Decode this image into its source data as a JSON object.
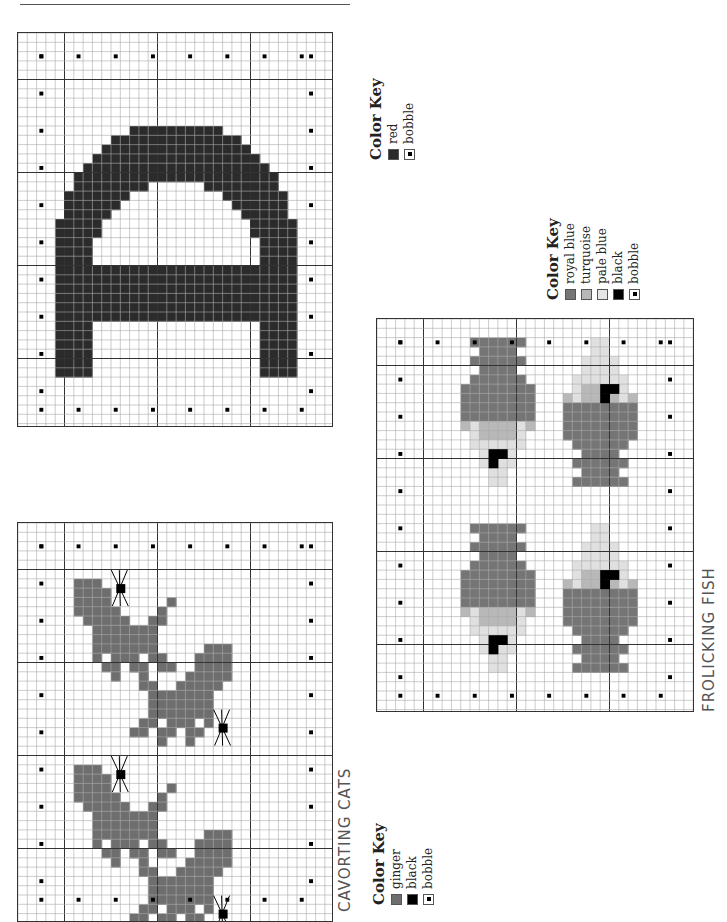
{
  "page": {
    "width": 727,
    "height": 913
  },
  "header_rule": true,
  "charts": [
    {
      "name": "letter-a-chart",
      "caption": "",
      "box": {
        "x": 17,
        "y": 32,
        "w": 316,
        "h": 395
      },
      "cell": 9.3,
      "colors": {
        "red": "#2b2b2b"
      },
      "motif": "letter-a-rotated"
    },
    {
      "name": "cavorting-cats-chart",
      "caption": "CAVORTING CATS",
      "box": {
        "x": 17,
        "y": 522,
        "w": 316,
        "h": 391
      },
      "cell": 9.3,
      "colors": {
        "ginger": "#6e6e6e",
        "black": "#000000"
      },
      "motif": "cats"
    },
    {
      "name": "frolicking-fish-chart",
      "caption": "FROLICKING FISH",
      "box": {
        "x": 376,
        "y": 318,
        "w": 318,
        "h": 394
      },
      "cell": 9.3,
      "colors": {
        "royal_blue": "#757575",
        "turquoise": "#b8b8b8",
        "pale_blue": "#e0e0e0",
        "black": "#000000"
      },
      "motif": "fish"
    }
  ],
  "keys": {
    "letter": {
      "title": "Color Key",
      "items": [
        {
          "label": "red",
          "color": "#2b2b2b",
          "type": "fill"
        },
        {
          "label": "bobble",
          "color": "#ffffff",
          "type": "bobble"
        }
      ]
    },
    "fish": {
      "title": "Color Key",
      "items": [
        {
          "label": "royal blue",
          "color": "#757575",
          "type": "fill"
        },
        {
          "label": "turquoise",
          "color": "#b8b8b8",
          "type": "fill"
        },
        {
          "label": "pale blue",
          "color": "#e6e6e6",
          "type": "fill"
        },
        {
          "label": "black",
          "color": "#000000",
          "type": "fill"
        },
        {
          "label": "bobble",
          "color": "#ffffff",
          "type": "bobble"
        }
      ]
    },
    "cats": {
      "title": "Color Key",
      "items": [
        {
          "label": "ginger",
          "color": "#6e6e6e",
          "type": "fill"
        },
        {
          "label": "black",
          "color": "#000000",
          "type": "fill"
        },
        {
          "label": "bobble",
          "color": "#ffffff",
          "type": "bobble"
        }
      ]
    }
  },
  "captions": {
    "cats": "CAVORTING CATS",
    "fish": "FROLICKING FISH"
  }
}
